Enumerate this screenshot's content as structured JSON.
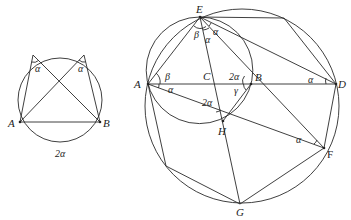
{
  "figure_left": {
    "points": {
      "A": "A",
      "B": "B"
    },
    "angle_labels": [
      "α",
      "α"
    ],
    "arc_label": "2α"
  },
  "figure_right": {
    "points": {
      "A": "A",
      "B": "B",
      "C": "C",
      "D": "D",
      "E": "E",
      "F": "F",
      "G": "G",
      "H": "H"
    },
    "angle_labels": {
      "E_left": "β",
      "E_mid": "α",
      "E_right": "α",
      "A_top": "β",
      "A_bottom": "α",
      "B_left_top": "2α",
      "B_left_bottom": "γ",
      "H_angle": "2α",
      "D_angle": "α",
      "F_angle": "α"
    }
  }
}
